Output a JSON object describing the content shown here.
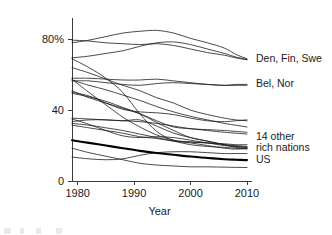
{
  "chart_data": {
    "type": "line",
    "title": "",
    "xlabel": "Year",
    "ylabel": "",
    "xlim": [
      1979,
      2010
    ],
    "ylim": [
      0,
      92
    ],
    "grid": false,
    "legend_position": "right-inline-annotations",
    "x_ticks": [
      1980,
      1990,
      2000,
      2010
    ],
    "x_tick_labels": [
      "1980",
      "1990",
      "2000",
      "2010"
    ],
    "y_ticks": [
      0,
      40,
      80
    ],
    "y_tick_labels": [
      "0",
      "40",
      "80%"
    ],
    "annotations": [
      {
        "id": "den-fin-swe",
        "text": "Den, Fin, Swe",
        "x": 2010,
        "y": 69
      },
      {
        "id": "bel-nor",
        "text": "Bel, Nor",
        "x": 2010,
        "y": 55
      },
      {
        "id": "14-other-rich-nations-line1",
        "text": "14 other",
        "x": 2010,
        "y": 25
      },
      {
        "id": "14-other-rich-nations-line2",
        "text": "rich nations",
        "x": 2010,
        "y": 19
      },
      {
        "id": "us",
        "text": "US",
        "x": 2010,
        "y": 12
      }
    ],
    "x": [
      1979,
      1982,
      1985,
      1988,
      1991,
      1994,
      1997,
      2000,
      2003,
      2006,
      2008,
      2010
    ],
    "series": [
      {
        "name": "Sweden",
        "group": "Den, Fin, Swe",
        "emphasis": "normal",
        "values": [
          78.0,
          79.5,
          81.5,
          83.5,
          84.5,
          85.0,
          83.5,
          80.5,
          78.0,
          75.0,
          71.5,
          69.0
        ]
      },
      {
        "name": "Denmark",
        "group": "Den, Fin, Swe",
        "emphasis": "normal",
        "values": [
          79.5,
          79.0,
          78.0,
          77.5,
          77.0,
          77.5,
          76.5,
          74.5,
          72.5,
          71.0,
          69.5,
          68.5
        ]
      },
      {
        "name": "Finland",
        "group": "Den, Fin, Swe",
        "emphasis": "normal",
        "values": [
          69.5,
          70.5,
          72.0,
          73.5,
          76.0,
          78.0,
          78.5,
          77.0,
          74.5,
          72.0,
          70.0,
          68.5
        ]
      },
      {
        "name": "Belgium",
        "group": "Bel, Nor",
        "emphasis": "normal",
        "values": [
          56.5,
          56.5,
          55.5,
          54.5,
          54.0,
          55.0,
          55.5,
          55.0,
          54.5,
          54.0,
          54.5,
          54.5
        ]
      },
      {
        "name": "Norway",
        "group": "Bel, Nor",
        "emphasis": "normal",
        "values": [
          58.0,
          58.0,
          57.5,
          57.0,
          57.0,
          57.5,
          56.5,
          55.5,
          54.5,
          54.0,
          54.0,
          54.0
        ]
      },
      {
        "name": "Ireland",
        "group": "14 other rich nations",
        "emphasis": "normal",
        "values": [
          64.0,
          61.0,
          57.5,
          54.0,
          51.0,
          47.0,
          44.0,
          40.0,
          37.5,
          35.5,
          34.5,
          34.0
        ]
      },
      {
        "name": "Austria",
        "group": "14 other rich nations",
        "emphasis": "normal",
        "values": [
          57.0,
          54.0,
          51.5,
          48.5,
          45.5,
          42.0,
          39.0,
          36.5,
          34.5,
          32.5,
          31.5,
          30.5
        ]
      },
      {
        "name": "Italy",
        "group": "14 other rich nations",
        "emphasis": "normal",
        "values": [
          50.0,
          48.0,
          44.0,
          40.5,
          39.0,
          38.5,
          37.5,
          35.5,
          34.0,
          33.5,
          34.0,
          34.5
        ]
      },
      {
        "name": "United Kingdom",
        "group": "14 other rich nations",
        "emphasis": "normal",
        "values": [
          51.0,
          47.0,
          44.0,
          41.0,
          38.0,
          34.0,
          30.5,
          29.5,
          28.5,
          27.5,
          27.0,
          26.5
        ]
      },
      {
        "name": "Australia",
        "group": "14 other rich nations",
        "emphasis": "normal",
        "values": [
          49.5,
          47.5,
          45.0,
          41.5,
          38.0,
          33.0,
          28.5,
          24.5,
          22.5,
          20.5,
          19.0,
          18.5
        ]
      },
      {
        "name": "New Zealand",
        "group": "14 other rich nations",
        "emphasis": "normal",
        "values": [
          69.0,
          64.0,
          58.0,
          50.0,
          38.0,
          28.0,
          23.0,
          22.0,
          21.5,
          21.0,
          20.5,
          20.5
        ]
      },
      {
        "name": "Germany",
        "group": "14 other rich nations",
        "emphasis": "normal",
        "values": [
          35.5,
          35.0,
          34.5,
          34.0,
          34.5,
          31.0,
          27.0,
          24.5,
          22.5,
          20.5,
          19.5,
          19.0
        ]
      },
      {
        "name": "Netherlands",
        "group": "14 other rich nations",
        "emphasis": "normal",
        "values": [
          35.0,
          32.0,
          28.5,
          25.5,
          24.5,
          25.0,
          24.5,
          23.0,
          21.5,
          20.0,
          19.5,
          19.0
        ]
      },
      {
        "name": "Canada",
        "group": "14 other rich nations",
        "emphasis": "normal",
        "values": [
          33.5,
          34.5,
          34.5,
          34.0,
          33.5,
          32.5,
          31.0,
          29.5,
          29.0,
          28.5,
          28.0,
          27.5
        ]
      },
      {
        "name": "Switzerland",
        "group": "14 other rich nations",
        "emphasis": "normal",
        "values": [
          32.5,
          31.5,
          30.0,
          28.5,
          26.5,
          24.5,
          22.5,
          20.5,
          19.5,
          19.0,
          18.5,
          18.0
        ]
      },
      {
        "name": "Japan",
        "group": "14 other rich nations",
        "emphasis": "normal",
        "values": [
          31.5,
          30.0,
          28.5,
          27.0,
          25.0,
          24.0,
          22.5,
          21.5,
          20.0,
          18.5,
          18.0,
          18.5
        ]
      },
      {
        "name": "Portugal",
        "group": "14 other rich nations",
        "emphasis": "normal",
        "values": [
          57.5,
          50.0,
          43.0,
          36.0,
          30.5,
          26.0,
          23.0,
          22.0,
          21.5,
          20.5,
          20.0,
          19.5
        ]
      },
      {
        "name": "Spain",
        "group": "14 other rich nations",
        "emphasis": "normal",
        "values": [
          13.5,
          12.5,
          12.0,
          12.5,
          14.5,
          16.0,
          16.5,
          16.5,
          16.0,
          15.5,
          15.5,
          15.5
        ]
      },
      {
        "name": "France",
        "group": "14 other rich nations",
        "emphasis": "normal",
        "values": [
          18.5,
          16.0,
          14.0,
          12.0,
          10.0,
          9.0,
          8.5,
          8.0,
          8.0,
          7.8,
          7.7,
          7.6
        ]
      },
      {
        "name": "United States",
        "group": "US",
        "emphasis": "bold",
        "values": [
          23.0,
          21.5,
          20.0,
          18.5,
          17.0,
          15.8,
          14.8,
          13.8,
          13.0,
          12.3,
          12.0,
          11.8
        ]
      }
    ]
  },
  "axes": {
    "y_axis_name": "union-membership-percent",
    "x_axis_name": "year"
  }
}
